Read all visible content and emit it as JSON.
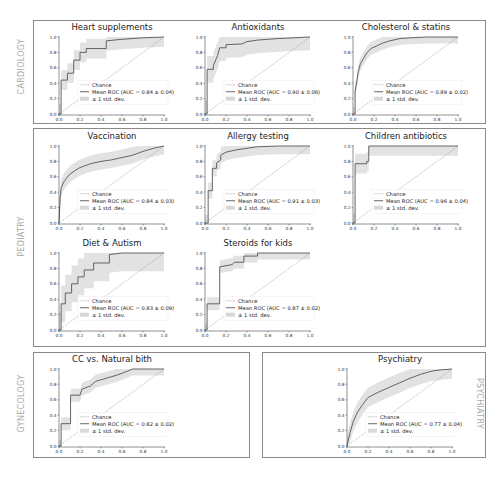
{
  "groups": [
    {
      "id": "cardiology",
      "label": "CARDIOLOGY"
    },
    {
      "id": "pediatry",
      "label": "PEDIATRY"
    },
    {
      "id": "gynecology",
      "label": "GYNECOLOGY"
    },
    {
      "id": "psychiatry",
      "label": "PSYCHIATRY"
    }
  ],
  "legend": {
    "chance": "Chance",
    "std": "± 1 std. dev."
  },
  "ticks": [
    "0.0",
    "0.2",
    "0.4",
    "0.6",
    "0.8",
    "1.0"
  ],
  "chart_data": [
    {
      "type": "line",
      "group": "CARDIOLOGY",
      "title": "Heart supplements",
      "mean_label": "Mean ROC (AUC = 0.84 ± 0.04)",
      "auc": 0.84,
      "auc_std": 0.04,
      "x": [
        0,
        0.02,
        0.02,
        0.08,
        0.08,
        0.14,
        0.14,
        0.2,
        0.2,
        0.26,
        0.26,
        0.45,
        0.45,
        0.6,
        0.8,
        1.0
      ],
      "y": [
        0,
        0,
        0.44,
        0.44,
        0.53,
        0.53,
        0.7,
        0.7,
        0.8,
        0.8,
        0.85,
        0.85,
        0.95,
        0.97,
        0.99,
        1.0
      ],
      "xlim": [
        0,
        1
      ],
      "ylim": [
        0,
        1
      ]
    },
    {
      "type": "line",
      "group": "CARDIOLOGY",
      "title": "Antioxidants",
      "mean_label": "Mean ROC (AUC = 0.90 ± 0.06)",
      "auc": 0.9,
      "auc_std": 0.06,
      "x": [
        0,
        0.02,
        0.02,
        0.08,
        0.08,
        0.12,
        0.14,
        0.2,
        0.2,
        0.35,
        0.4,
        0.5,
        0.7,
        1.0
      ],
      "y": [
        0,
        0,
        0.58,
        0.58,
        0.63,
        0.76,
        0.86,
        0.86,
        0.9,
        0.91,
        0.94,
        0.96,
        0.98,
        1.0
      ],
      "xlim": [
        0,
        1
      ],
      "ylim": [
        0,
        1
      ]
    },
    {
      "type": "line",
      "group": "CARDIOLOGY",
      "title": "Cholesterol & statins",
      "mean_label": "Mean ROC (AUC = 0.89 ± 0.02)",
      "auc": 0.89,
      "auc_std": 0.02,
      "x": [
        0,
        0.02,
        0.02,
        0.04,
        0.05,
        0.07,
        0.1,
        0.13,
        0.17,
        0.22,
        0.28,
        0.35,
        0.45,
        0.55,
        0.7,
        1.0
      ],
      "y": [
        0,
        0,
        0.3,
        0.45,
        0.55,
        0.65,
        0.72,
        0.79,
        0.85,
        0.88,
        0.92,
        0.95,
        0.98,
        0.99,
        1.0,
        1.0
      ],
      "xlim": [
        0,
        1
      ],
      "ylim": [
        0,
        1
      ]
    },
    {
      "type": "line",
      "group": "PEDIATRY",
      "title": "Vaccination",
      "mean_label": "Mean ROC (AUC = 0.84 ± 0.03)",
      "auc": 0.84,
      "auc_std": 0.03,
      "x": [
        0,
        0.01,
        0.02,
        0.04,
        0.07,
        0.1,
        0.15,
        0.2,
        0.3,
        0.4,
        0.5,
        0.6,
        0.7,
        0.8,
        0.9,
        1.0
      ],
      "y": [
        0,
        0.3,
        0.45,
        0.52,
        0.58,
        0.63,
        0.68,
        0.72,
        0.77,
        0.8,
        0.82,
        0.85,
        0.88,
        0.93,
        0.97,
        1.0
      ],
      "xlim": [
        0,
        1
      ],
      "ylim": [
        0,
        1
      ]
    },
    {
      "type": "line",
      "group": "PEDIATRY",
      "title": "Allergy testing",
      "mean_label": "Mean ROC (AUC = 0.91 ± 0.03)",
      "auc": 0.91,
      "auc_std": 0.03,
      "x": [
        0,
        0.03,
        0.03,
        0.07,
        0.07,
        0.11,
        0.11,
        0.15,
        0.15,
        0.2,
        0.3,
        0.4,
        0.5,
        0.7,
        1.0
      ],
      "y": [
        0,
        0,
        0.42,
        0.42,
        0.71,
        0.71,
        0.78,
        0.82,
        0.88,
        0.92,
        0.95,
        0.97,
        0.99,
        1.0,
        1.0
      ],
      "xlim": [
        0,
        1
      ],
      "ylim": [
        0,
        1
      ]
    },
    {
      "type": "line",
      "group": "PEDIATRY",
      "title": "Children antibiotics",
      "mean_label": "Mean ROC (AUC = 0.96 ± 0.04)",
      "auc": 0.96,
      "auc_std": 0.04,
      "x": [
        0,
        0.02,
        0.02,
        0.13,
        0.13,
        0.15,
        0.15,
        1.0
      ],
      "y": [
        0,
        0,
        0.77,
        0.77,
        0.8,
        0.8,
        1.0,
        1.0
      ],
      "xlim": [
        0,
        1
      ],
      "ylim": [
        0,
        1
      ]
    },
    {
      "type": "line",
      "group": "PEDIATRY",
      "title": "Diet & Autism",
      "mean_label": "Mean ROC (AUC = 0.83 ± 0.09)",
      "auc": 0.83,
      "auc_std": 0.09,
      "x": [
        0,
        0.02,
        0.02,
        0.06,
        0.06,
        0.12,
        0.12,
        0.18,
        0.18,
        0.24,
        0.24,
        0.33,
        0.33,
        0.48,
        0.48,
        0.6,
        1.0
      ],
      "y": [
        0,
        0,
        0.34,
        0.34,
        0.48,
        0.48,
        0.6,
        0.6,
        0.69,
        0.69,
        0.78,
        0.78,
        0.87,
        0.87,
        0.98,
        1.0,
        1.0
      ],
      "xlim": [
        0,
        1
      ],
      "ylim": [
        0,
        1
      ]
    },
    {
      "type": "line",
      "group": "PEDIATRY",
      "title": "Steroids for kids",
      "mean_label": "Mean ROC (AUC = 0.87 ± 0.02)",
      "auc": 0.87,
      "auc_std": 0.02,
      "x": [
        0,
        0.02,
        0.02,
        0.14,
        0.14,
        0.26,
        0.28,
        0.37,
        0.37,
        0.5,
        0.5,
        1.0
      ],
      "y": [
        0,
        0,
        0.34,
        0.34,
        0.82,
        0.85,
        0.88,
        0.88,
        0.96,
        0.96,
        1.0,
        1.0
      ],
      "xlim": [
        0,
        1
      ],
      "ylim": [
        0,
        1
      ]
    },
    {
      "type": "line",
      "group": "GYNECOLOGY",
      "title": "CC vs. Natural bith",
      "mean_label": "Mean ROC (AUC = 0.82 ± 0.02)",
      "auc": 0.82,
      "auc_std": 0.02,
      "x": [
        0,
        0.02,
        0.02,
        0.11,
        0.11,
        0.2,
        0.22,
        0.3,
        0.35,
        0.45,
        0.55,
        0.65,
        0.7,
        1.0
      ],
      "y": [
        0,
        0,
        0.29,
        0.29,
        0.66,
        0.66,
        0.74,
        0.78,
        0.84,
        0.88,
        0.92,
        0.97,
        1.0,
        1.0
      ],
      "xlim": [
        0,
        1
      ],
      "ylim": [
        0,
        1
      ]
    },
    {
      "type": "line",
      "group": "PSYCHIATRY",
      "title": "Psychiatry",
      "mean_label": "Mean ROC (AUC = 0.77 ± 0.04)",
      "auc": 0.77,
      "auc_std": 0.04,
      "x": [
        0,
        0.03,
        0.06,
        0.1,
        0.15,
        0.2,
        0.3,
        0.4,
        0.5,
        0.6,
        0.7,
        0.8,
        0.9,
        1.0
      ],
      "y": [
        0,
        0.18,
        0.32,
        0.44,
        0.54,
        0.63,
        0.7,
        0.76,
        0.82,
        0.88,
        0.93,
        0.97,
        0.99,
        1.0
      ],
      "xlim": [
        0,
        1
      ],
      "ylim": [
        0,
        1
      ]
    }
  ]
}
